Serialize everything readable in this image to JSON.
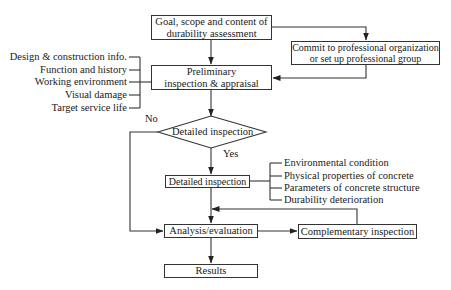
{
  "diagram": {
    "nodes": {
      "goal": {
        "line1": "Goal, scope and content of",
        "line2": "durability assessment"
      },
      "commit": {
        "line1": "Commit to professional organization",
        "line2": "or set up professional group"
      },
      "preliminary": {
        "line1": "Preliminary",
        "line2": "inspection & appraisal"
      },
      "decision": {
        "label": "Detailed inspection"
      },
      "detailed": {
        "label": "Detailed inspection"
      },
      "analysis": {
        "label": "Analysis/evaluation"
      },
      "complementary": {
        "label": "Complementary inspection"
      },
      "results": {
        "label": "Results"
      }
    },
    "preliminary_inputs": [
      "Design & construction info.",
      "Function and history",
      "Working environment",
      "Visual damage",
      "Target service life"
    ],
    "detailed_items": [
      "Environmental condition",
      "Physical properties of concrete",
      "Parameters of concrete structure",
      "Durability deterioration"
    ],
    "edge_labels": {
      "no": "No",
      "yes": "Yes"
    }
  }
}
